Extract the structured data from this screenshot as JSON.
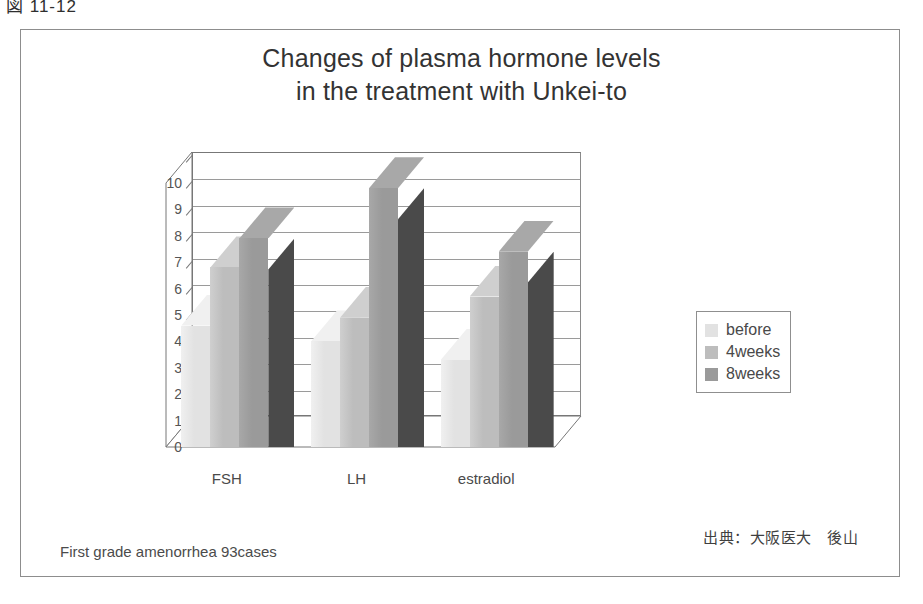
{
  "figure": {
    "caption": "図 11-12",
    "footnote_left": "First grade amenorrhea 93cases",
    "footnote_right": "出典：大阪医大　後山"
  },
  "legend": {
    "position": "right",
    "entries": [
      {
        "label": "before",
        "color": "#e2e2e2"
      },
      {
        "label": "4weeks",
        "color": "#bdbdbd"
      },
      {
        "label": "8weeks",
        "color": "#9a9a9a"
      }
    ]
  },
  "colors": {
    "before_face": "#e2e2e2",
    "before_cap": "#f0f0f0",
    "weeks4_face": "#bdbdbd",
    "weeks4_cap": "#cfcfcf",
    "weeks8_face": "#9a9a9a",
    "weeks8_cap": "#a8a8a8",
    "weeks8_side": "#4a4a4a",
    "axis": "#777777",
    "gridline": "#9a9a9a",
    "frame": "#8d8d8d"
  },
  "chart_data": {
    "type": "bar",
    "title": "Changes of plasma hormone levels in the treatment with Unkei-to",
    "title_lines": [
      "Changes of plasma hormone levels",
      "in the treatment with Unkei-to"
    ],
    "xlabel": "",
    "ylabel": "",
    "ylim": [
      0,
      10
    ],
    "yticks": [
      0,
      1,
      2,
      3,
      4,
      5,
      6,
      7,
      8,
      9,
      10
    ],
    "grid": true,
    "categories": [
      "FSH",
      "LH",
      "estradiol"
    ],
    "series": [
      {
        "name": "before",
        "values": [
          4.6,
          4.0,
          3.3
        ]
      },
      {
        "name": "4weeks",
        "values": [
          6.8,
          4.9,
          5.7
        ]
      },
      {
        "name": "8weeks",
        "values": [
          7.9,
          9.8,
          7.4
        ]
      }
    ]
  }
}
